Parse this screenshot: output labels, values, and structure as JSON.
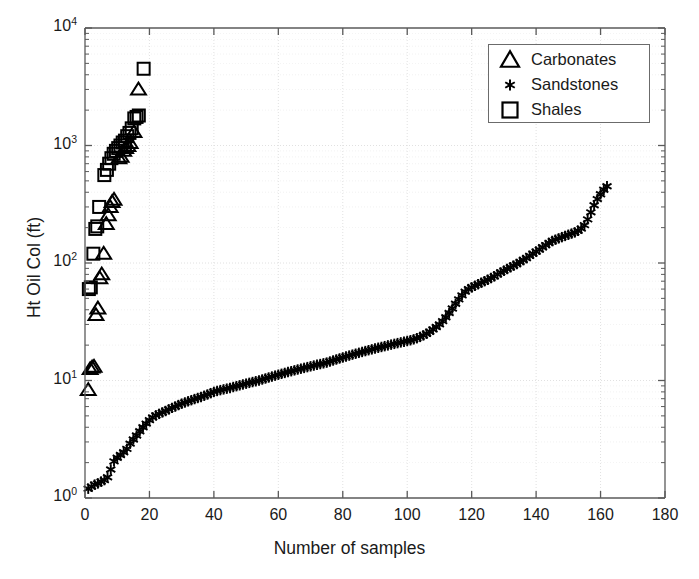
{
  "chart_data": {
    "type": "scatter",
    "title": "",
    "xlabel": "Number of samples",
    "ylabel": "Ht Oil Col (ft)",
    "xlim": [
      0,
      180
    ],
    "ylim": [
      1,
      10000
    ],
    "yscale": "log",
    "xscale": "linear",
    "grid": true,
    "xticks": [
      "0",
      "20",
      "40",
      "60",
      "80",
      "100",
      "120",
      "140",
      "160",
      "180"
    ],
    "xtick_values": [
      0,
      20,
      40,
      60,
      80,
      100,
      120,
      140,
      160,
      180
    ],
    "ytick_values": [
      1,
      10,
      100,
      1000,
      10000
    ],
    "yticks": [
      "10^0",
      "10^1",
      "10^2",
      "10^3",
      "10^4"
    ],
    "legend_position": "top-right",
    "series": [
      {
        "name": "Carbonates",
        "marker": "triangle",
        "color": "#000000",
        "points": [
          [
            1.0,
            8.3
          ],
          [
            1.6,
            12.5
          ],
          [
            2.2,
            12.9
          ],
          [
            2.8,
            13.1
          ],
          [
            3.4,
            36.0
          ],
          [
            4.0,
            41.0
          ],
          [
            4.6,
            74.0
          ],
          [
            5.2,
            80.0
          ],
          [
            5.8,
            120.0
          ],
          [
            6.6,
            215.0
          ],
          [
            7.2,
            255.0
          ],
          [
            7.8,
            300.0
          ],
          [
            8.4,
            330.0
          ],
          [
            9.0,
            345.0
          ],
          [
            10.5,
            780.0
          ],
          [
            11.2,
            800.0
          ],
          [
            12.0,
            900.0
          ],
          [
            12.6,
            950.0
          ],
          [
            13.3,
            990.0
          ],
          [
            14.0,
            1050.0
          ],
          [
            15.2,
            1300.0
          ],
          [
            16.6,
            3000.0
          ]
        ]
      },
      {
        "name": "Sandstones",
        "marker": "asterisk",
        "color": "#000000",
        "points": [
          [
            1,
            1.2
          ],
          [
            2,
            1.25
          ],
          [
            3,
            1.3
          ],
          [
            4,
            1.33
          ],
          [
            5,
            1.38
          ],
          [
            6,
            1.42
          ],
          [
            7,
            1.5
          ],
          [
            8,
            1.75
          ],
          [
            9,
            2.05
          ],
          [
            10,
            2.2
          ],
          [
            11,
            2.32
          ],
          [
            12,
            2.45
          ],
          [
            13,
            2.62
          ],
          [
            14,
            2.9
          ],
          [
            15,
            3.15
          ],
          [
            16,
            3.4
          ],
          [
            17,
            3.7
          ],
          [
            18,
            4.0
          ],
          [
            19,
            4.3
          ],
          [
            20,
            4.6
          ],
          [
            21,
            4.85
          ],
          [
            22,
            5.05
          ],
          [
            23,
            5.2
          ],
          [
            24,
            5.35
          ],
          [
            25,
            5.5
          ],
          [
            26,
            5.68
          ],
          [
            27,
            5.85
          ],
          [
            28,
            6.0
          ],
          [
            29,
            6.18
          ],
          [
            30,
            6.35
          ],
          [
            31,
            6.5
          ],
          [
            32,
            6.65
          ],
          [
            33,
            6.8
          ],
          [
            34,
            6.95
          ],
          [
            35,
            7.1
          ],
          [
            36,
            7.25
          ],
          [
            37,
            7.42
          ],
          [
            38,
            7.6
          ],
          [
            39,
            7.8
          ],
          [
            40,
            8.0
          ],
          [
            41,
            8.15
          ],
          [
            42,
            8.28
          ],
          [
            43,
            8.4
          ],
          [
            44,
            8.52
          ],
          [
            45,
            8.65
          ],
          [
            46,
            8.8
          ],
          [
            47,
            8.95
          ],
          [
            48,
            9.1
          ],
          [
            49,
            9.25
          ],
          [
            50,
            9.4
          ],
          [
            51,
            9.55
          ],
          [
            52,
            9.7
          ],
          [
            53,
            9.85
          ],
          [
            54,
            10.0
          ],
          [
            55,
            10.2
          ],
          [
            56,
            10.4
          ],
          [
            57,
            10.6
          ],
          [
            58,
            10.8
          ],
          [
            59,
            11.0
          ],
          [
            60,
            11.2
          ],
          [
            61,
            11.4
          ],
          [
            62,
            11.6
          ],
          [
            63,
            11.8
          ],
          [
            64,
            12.0
          ],
          [
            65,
            12.2
          ],
          [
            66,
            12.4
          ],
          [
            67,
            12.6
          ],
          [
            68,
            12.8
          ],
          [
            69,
            13.0
          ],
          [
            70,
            13.2
          ],
          [
            71,
            13.4
          ],
          [
            72,
            13.6
          ],
          [
            73,
            13.8
          ],
          [
            74,
            14.0
          ],
          [
            75,
            14.2
          ],
          [
            76,
            14.5
          ],
          [
            77,
            14.8
          ],
          [
            78,
            15.1
          ],
          [
            79,
            15.4
          ],
          [
            80,
            15.7
          ],
          [
            81,
            16.0
          ],
          [
            82,
            16.3
          ],
          [
            83,
            16.6
          ],
          [
            84,
            16.9
          ],
          [
            85,
            17.2
          ],
          [
            86,
            17.5
          ],
          [
            87,
            17.8
          ],
          [
            88,
            18.1
          ],
          [
            89,
            18.4
          ],
          [
            90,
            18.7
          ],
          [
            91,
            19.0
          ],
          [
            92,
            19.3
          ],
          [
            93,
            19.6
          ],
          [
            94,
            19.9
          ],
          [
            95,
            20.2
          ],
          [
            96,
            20.5
          ],
          [
            97,
            20.8
          ],
          [
            98,
            21.1
          ],
          [
            99,
            21.4
          ],
          [
            100,
            21.7
          ],
          [
            101,
            22.0
          ],
          [
            102,
            22.4
          ],
          [
            103,
            22.9
          ],
          [
            104,
            23.5
          ],
          [
            105,
            24.2
          ],
          [
            106,
            25.0
          ],
          [
            107,
            26.0
          ],
          [
            108,
            27.2
          ],
          [
            109,
            28.5
          ],
          [
            110,
            30.0
          ],
          [
            111,
            32.0
          ],
          [
            112,
            34.5
          ],
          [
            113,
            37.5
          ],
          [
            114,
            41.0
          ],
          [
            115,
            45.0
          ],
          [
            116,
            49.0
          ],
          [
            117,
            53.0
          ],
          [
            118,
            57.0
          ],
          [
            119,
            60.0
          ],
          [
            120,
            62.0
          ],
          [
            121,
            64.0
          ],
          [
            122,
            66.0
          ],
          [
            123,
            68.0
          ],
          [
            124,
            70.0
          ],
          [
            125,
            72.0
          ],
          [
            126,
            74.5
          ],
          [
            127,
            77.0
          ],
          [
            128,
            80.0
          ],
          [
            129,
            83.0
          ],
          [
            130,
            86.0
          ],
          [
            131,
            89.0
          ],
          [
            132,
            92.0
          ],
          [
            133,
            95.0
          ],
          [
            134,
            98.0
          ],
          [
            135,
            102.0
          ],
          [
            136,
            106.0
          ],
          [
            137,
            110.0
          ],
          [
            138,
            115.0
          ],
          [
            139,
            120.0
          ],
          [
            140,
            125.0
          ],
          [
            141,
            130.0
          ],
          [
            142,
            136.0
          ],
          [
            143,
            142.0
          ],
          [
            144,
            148.0
          ],
          [
            145,
            154.0
          ],
          [
            146,
            158.0
          ],
          [
            147,
            162.0
          ],
          [
            148,
            166.0
          ],
          [
            149,
            170.0
          ],
          [
            150,
            174.0
          ],
          [
            151,
            178.0
          ],
          [
            152,
            182.0
          ],
          [
            153,
            188.0
          ],
          [
            154,
            196.0
          ],
          [
            155,
            210.0
          ],
          [
            156,
            235.0
          ],
          [
            157,
            270.0
          ],
          [
            158,
            310.0
          ],
          [
            159,
            350.0
          ],
          [
            160,
            385.0
          ],
          [
            161,
            420.0
          ],
          [
            162,
            450.0
          ]
        ]
      },
      {
        "name": "Shales",
        "marker": "square",
        "color": "#000000",
        "points": [
          [
            1.2,
            60.0
          ],
          [
            1.8,
            62.0
          ],
          [
            2.6,
            120.0
          ],
          [
            3.2,
            195.0
          ],
          [
            3.8,
            205.0
          ],
          [
            4.4,
            300.0
          ],
          [
            6.0,
            560.0
          ],
          [
            6.8,
            620.0
          ],
          [
            7.5,
            700.0
          ],
          [
            8.2,
            780.0
          ],
          [
            8.9,
            850.0
          ],
          [
            9.6,
            900.0
          ],
          [
            10.3,
            950.0
          ],
          [
            11.0,
            1000.0
          ],
          [
            11.7,
            1060.0
          ],
          [
            12.4,
            1100.0
          ],
          [
            13.1,
            1200.0
          ],
          [
            13.8,
            1280.0
          ],
          [
            14.5,
            1400.0
          ],
          [
            15.3,
            1700.0
          ],
          [
            16.0,
            1750.0
          ],
          [
            16.7,
            1800.0
          ],
          [
            18.2,
            4500.0
          ]
        ]
      }
    ]
  },
  "legend": {
    "entries": [
      {
        "label": "Carbonates",
        "marker": "triangle"
      },
      {
        "label": "Sandstones",
        "marker": "asterisk"
      },
      {
        "label": "Shales",
        "marker": "square"
      }
    ]
  },
  "colors": {
    "marker": "#000000",
    "axis": "#5a5a5a",
    "grid": "#dcdcdc",
    "text": "#1a1a1a",
    "background": "#ffffff"
  }
}
